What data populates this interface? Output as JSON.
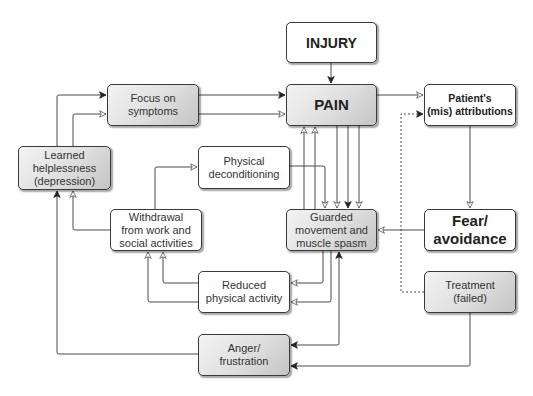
{
  "diagram": {
    "type": "flowchart",
    "title": "",
    "nodes": {
      "injury": {
        "label": "INJURY",
        "style": "bold-white"
      },
      "pain": {
        "label": "PAIN",
        "style": "bold-shaded"
      },
      "attributions": {
        "label": "Patient's\n(mis) attributions",
        "style": "bold-white"
      },
      "focus": {
        "label": "Focus on\nsymptoms",
        "style": "shaded"
      },
      "helplessness": {
        "label": "Learned\nhelplessness\n(depression)",
        "style": "shaded"
      },
      "deconditioning": {
        "label": "Physical\ndeconditioning",
        "style": "white"
      },
      "withdrawal": {
        "label": "Withdrawal\nfrom work and\nsocial activities",
        "style": "white"
      },
      "guarded": {
        "label": "Guarded\nmovement and\nmuscle spasm",
        "style": "shaded"
      },
      "fear": {
        "label": "Fear/\navoidance",
        "style": "bold-white-large"
      },
      "reduced": {
        "label": "Reduced\nphysical activity",
        "style": "white"
      },
      "treatment": {
        "label": "Treatment\n(failed)",
        "style": "shaded"
      },
      "anger": {
        "label": "Anger/\nfrustration",
        "style": "shaded"
      }
    },
    "edges": [
      {
        "from": "injury",
        "to": "pain",
        "style": "solid"
      },
      {
        "from": "pain",
        "to": "attributions",
        "style": "solid"
      },
      {
        "from": "attributions",
        "to": "fear",
        "style": "solid"
      },
      {
        "from": "fear",
        "to": "guarded",
        "style": "solid"
      },
      {
        "from": "treatment",
        "to": "attributions",
        "style": "dotted"
      },
      {
        "from": "treatment",
        "to": "anger",
        "style": "solid"
      },
      {
        "from": "focus",
        "to": "pain",
        "style": "solid",
        "count": 2
      },
      {
        "from": "helplessness",
        "to": "focus",
        "style": "solid",
        "count": 2
      },
      {
        "from": "pain",
        "to": "guarded",
        "style": "solid",
        "count": 3
      },
      {
        "from": "guarded",
        "to": "pain",
        "style": "solid",
        "count": 2
      },
      {
        "from": "deconditioning",
        "to": "guarded",
        "style": "solid"
      },
      {
        "from": "withdrawal",
        "to": "deconditioning",
        "style": "solid"
      },
      {
        "from": "withdrawal",
        "to": "helplessness",
        "style": "solid"
      },
      {
        "from": "guarded",
        "to": "reduced",
        "style": "solid",
        "count": 2
      },
      {
        "from": "reduced",
        "to": "withdrawal",
        "style": "solid",
        "count": 2
      },
      {
        "from": "anger",
        "to": "guarded",
        "style": "solid"
      },
      {
        "from": "guarded",
        "to": "anger",
        "style": "solid"
      },
      {
        "from": "anger",
        "to": "helplessness",
        "style": "solid"
      }
    ],
    "colors": {
      "line": "#4a4a4a",
      "border": "#3a3a3a",
      "shade_light": "#f3f3f3",
      "shade_dark": "#c4c4c4"
    }
  }
}
